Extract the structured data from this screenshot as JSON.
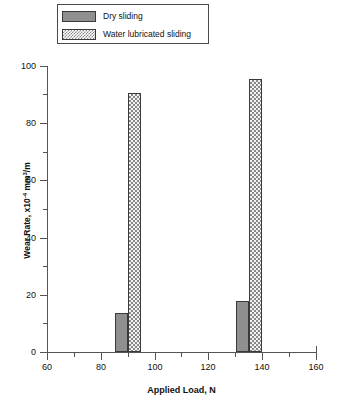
{
  "legend": {
    "position": "top-left",
    "entries": [
      {
        "label": "Dry sliding",
        "swatch": "solid-gray-swatch",
        "color": "#8f8f8f"
      },
      {
        "label": "Water lubricated sliding",
        "swatch": "checkered-swatch",
        "color": "#8a8a8a"
      }
    ]
  },
  "axes": {
    "x": {
      "title": "Applied Load, N",
      "ticks": [
        "60",
        "80",
        "100",
        "120",
        "140",
        "160"
      ],
      "tick_values": [
        60,
        80,
        100,
        120,
        140,
        160
      ],
      "minor_tick_values": [
        70,
        90,
        110,
        130,
        150
      ],
      "min": 60,
      "max": 160
    },
    "y": {
      "title_prefix": "Wear Rate, x10",
      "title_exponent": "-4",
      "title_suffix": " mm",
      "title_suffix_exponent": "3",
      "title_tail": "/m",
      "title_plain": "Wear Rate, x10-4 mm3/m",
      "ticks": [
        "0",
        "20",
        "40",
        "60",
        "80",
        "100"
      ],
      "tick_values": [
        0,
        20,
        40,
        60,
        80,
        100
      ],
      "minor_tick_values": [
        10,
        30,
        50,
        70,
        90
      ],
      "min": 0,
      "max": 100
    }
  },
  "chart_data": {
    "type": "bar",
    "title": "",
    "xlabel": "Applied Load, N",
    "ylabel": "Wear Rate, x10-4 mm3/m",
    "xlim": [
      60,
      160
    ],
    "ylim": [
      0,
      100
    ],
    "grid": false,
    "legend_position": "top-left",
    "categories": [
      "90",
      "135"
    ],
    "x": [
      90,
      135
    ],
    "series": [
      {
        "name": "Dry sliding",
        "fill": "solid",
        "color": "#8f8f8f",
        "values": [
          13.5,
          18.0
        ]
      },
      {
        "name": "Water lubricated sliding",
        "fill": "checkered",
        "color": "#8a8a8a",
        "values": [
          90.5,
          95.5
        ]
      }
    ]
  }
}
